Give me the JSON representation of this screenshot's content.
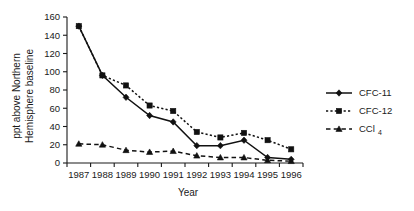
{
  "chart_data": {
    "type": "line",
    "title": "",
    "xlabel": "Year",
    "ylabel": "ppt above Northern Hemisphere baseline",
    "ylabel_line1": "ppt above Northern",
    "ylabel_line2": "Hemisphere baseline",
    "categories": [
      "1987",
      "1988",
      "1989",
      "1990",
      "1991",
      "1992",
      "1993",
      "1994",
      "1995",
      "1996"
    ],
    "xlim": [
      1986.5,
      1996.5
    ],
    "ylim": [
      0,
      160
    ],
    "yticks": [
      0,
      20,
      40,
      60,
      80,
      100,
      120,
      140,
      160
    ],
    "ytick_labels": [
      "0",
      "20",
      "40",
      "60",
      "80",
      "100",
      "120",
      "140",
      "160"
    ],
    "grid": false,
    "legend_position": "right",
    "series": [
      {
        "name": "CFC-11",
        "marker": "diamond",
        "linestyle": "solid",
        "color": "#111111",
        "values": [
          150,
          96,
          72,
          52,
          45,
          19,
          19,
          25,
          6,
          4
        ]
      },
      {
        "name": "CFC-12",
        "marker": "square",
        "linestyle": "dotted",
        "color": "#111111",
        "values": [
          150,
          96,
          85,
          63,
          57,
          34,
          28,
          33,
          25,
          15
        ]
      },
      {
        "name": "CCl4",
        "marker": "triangle",
        "linestyle": "dashed",
        "color": "#111111",
        "values": [
          21,
          20,
          14,
          12,
          13,
          8,
          6,
          6,
          3,
          2
        ]
      }
    ]
  },
  "legend": {
    "items": [
      {
        "label": "CFC-11",
        "sub": "",
        "marker": "diamond",
        "linestyle": "solid"
      },
      {
        "label": "CFC-12",
        "sub": "",
        "marker": "square",
        "linestyle": "dotted"
      },
      {
        "label": "CCl",
        "sub": "4",
        "marker": "triangle",
        "linestyle": "dashed"
      }
    ]
  }
}
